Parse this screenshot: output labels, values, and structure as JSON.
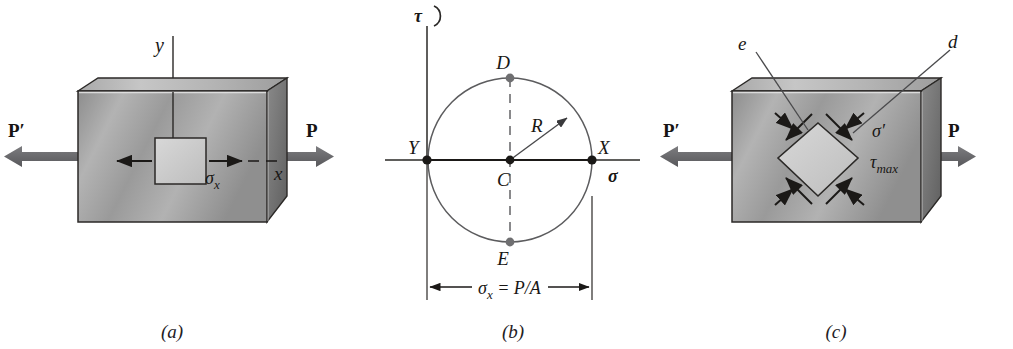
{
  "figure": {
    "background": "#ffffff",
    "width": 1013,
    "height": 349
  },
  "colors": {
    "arrow_load": "#6e6e71",
    "block_front": "#9c9c9c",
    "block_top": "#b9b9b9",
    "block_side": "#6f6f70",
    "element_fill": "#cfcfcf",
    "ink": "#1b1917",
    "circle_stroke": "#5c5c5e",
    "dash_stroke": "#7d7d7f",
    "point_fill": "#1b1917",
    "point_gray": "#6f6f71"
  },
  "panels": [
    {
      "id": "a",
      "caption": "(a)",
      "caption_x": 172,
      "caption_y": 338,
      "description": "Prismatic bar under axial load with a stress element aligned to x-y axes",
      "labels": {
        "load_left": "P′",
        "load_right": "P",
        "axis_y": "y",
        "axis_x": "x",
        "stress_x": "σ",
        "stress_x_sub": "x"
      }
    },
    {
      "id": "b",
      "caption": "(b)",
      "caption_x": 513,
      "caption_y": 338,
      "description": "Mohr's circle for uniaxial tension",
      "labels": {
        "axis_tau": "τ",
        "axis_sigma": "σ",
        "point_y": "Y",
        "point_x": "X",
        "point_c": "C",
        "point_d": "D",
        "point_e": "E",
        "radius": "R",
        "dimension": "σ",
        "dimension_sub": "x",
        "dimension_rest": " = P/A"
      },
      "geometry": {
        "center_x": 510,
        "center_y": 160,
        "radius": 82,
        "sigma_axis_y": 160,
        "tau_axis_x": 427
      }
    },
    {
      "id": "c",
      "caption": "(c)",
      "caption_x": 836,
      "caption_y": 338,
      "description": "Same bar with a stress element rotated 45 degrees showing maximum shear",
      "labels": {
        "load_left": "P′",
        "load_right": "P",
        "leader_e": "e",
        "leader_d": "d",
        "stress_prime": "σ′",
        "shear_max": "τ",
        "shear_max_sub": "max"
      }
    }
  ]
}
